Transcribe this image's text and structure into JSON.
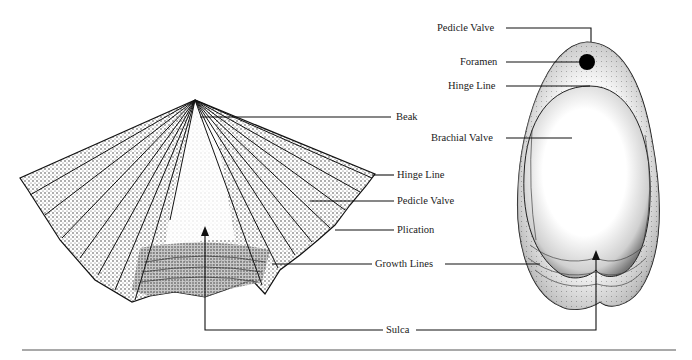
{
  "figure": {
    "left_specimen": {
      "view": "spiriferid brachiopod (pedicle valve view)",
      "labels": {
        "beak": "Beak",
        "hinge_line": "Hinge Line",
        "pedicle_valve": "Pedicle Valve",
        "plication": "Plication"
      }
    },
    "right_specimen": {
      "view": "terebratulid brachiopod (brachial valve view)",
      "labels": {
        "pedicle_valve": "Pedicle Valve",
        "foramen": "Foramen",
        "hinge_line": "Hinge Line",
        "brachial_valve": "Brachial Valve"
      }
    },
    "shared_labels": {
      "growth_lines": "Growth Lines",
      "sulca": "Sulca"
    },
    "colors": {
      "ink": "#1a1a1a",
      "paper": "#ffffff",
      "rule": "#555555"
    }
  }
}
